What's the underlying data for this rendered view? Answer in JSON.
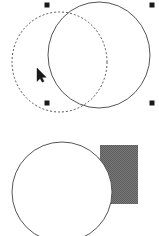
{
  "canvas": {
    "width": 159,
    "height": 236,
    "background_color": "#ffffff",
    "label": "drawing-canvas"
  },
  "palette": {
    "stroke": "#555555",
    "stroke_dark": "#3a3a3a",
    "fill_white": "#ffffff",
    "fill_gray": "#6e6e6e",
    "handle": "#1a1a1a",
    "cursor": "#1a1a1a"
  },
  "groups": [
    {
      "name": "top-selected-group",
      "selected": true,
      "shapes": [
        {
          "name": "dashed-circle",
          "type": "ellipse",
          "cx": 59.5,
          "cy": 62,
          "rx": 47.5,
          "ry": 50,
          "stroke": "#555555",
          "stroke_width": 1,
          "dash": "2 2",
          "fill": "none"
        },
        {
          "name": "solid-circle",
          "type": "ellipse",
          "cx": 99,
          "cy": 55,
          "rx": 51,
          "ry": 53,
          "stroke": "#555555",
          "stroke_width": 1,
          "dash": "none",
          "fill": "none"
        }
      ],
      "handles": [
        {
          "name": "handle-top-left",
          "x": 47,
          "y": 5,
          "size": 5
        },
        {
          "name": "handle-top-right",
          "x": 152,
          "y": 5,
          "size": 5
        },
        {
          "name": "handle-bottom-left",
          "x": 47,
          "y": 103,
          "size": 5
        },
        {
          "name": "handle-bottom-right",
          "x": 152,
          "y": 103,
          "size": 5
        }
      ]
    },
    {
      "name": "bottom-group",
      "selected": false,
      "shapes": [
        {
          "name": "gray-rectangle",
          "type": "rect",
          "x": 100,
          "y": 145,
          "width": 38,
          "height": 59,
          "fill": "#6e6e6e",
          "stroke": "none"
        },
        {
          "name": "white-circle",
          "type": "ellipse",
          "cx": 62,
          "cy": 192,
          "rx": 50,
          "ry": 50,
          "stroke": "#555555",
          "stroke_width": 1,
          "dash": "none",
          "fill": "#ffffff"
        }
      ],
      "handles": []
    }
  ],
  "cursor": {
    "name": "mouse-pointer",
    "x": 37,
    "y": 68,
    "width": 9,
    "height": 14,
    "color": "#1a1a1a"
  }
}
